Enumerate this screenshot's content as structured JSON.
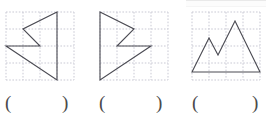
{
  "worksheet": {
    "title": "Geometry figures on dotted grid with blank answer parentheses",
    "background_color": "#ffffff",
    "grid": {
      "line_color": "#c9c9d4",
      "style": "dotted",
      "cols": 4,
      "rows": 4,
      "cell_px": 17
    },
    "figure_stroke_color": "#4a4a52",
    "figure_stroke_width": 1.1
  },
  "problems": [
    {
      "id": "problem-1",
      "figure_name": "left-pointing-arrow-zigzag",
      "description": "Left-pointing concave arrow shape: vertical right edge with a notched zigzag left side",
      "points": "51,0 17,17 34,34 0,34 51,68",
      "closed": true,
      "answer": {
        "open_paren": "(",
        "close_paren": ")",
        "value": ""
      }
    },
    {
      "id": "problem-2",
      "figure_name": "right-pointing-arrow-zigzag",
      "description": "Right-pointing concave arrow shape: vertical left edge with a notched zigzag right side (mirror of figure 1)",
      "points": "0,0 34,17 17,34 51,34 0,68",
      "closed": true,
      "answer": {
        "open_paren": "(",
        "close_paren": ")",
        "value": ""
      }
    },
    {
      "id": "problem-3",
      "figure_name": "double-peak-mountain",
      "description": "Mountain outline with two peaks sitting on a horizontal base",
      "points": "0,60 17,26 26,43 43,9 68,60",
      "closed": true,
      "answer": {
        "open_paren": "(",
        "close_paren": ")",
        "value": ""
      }
    }
  ]
}
